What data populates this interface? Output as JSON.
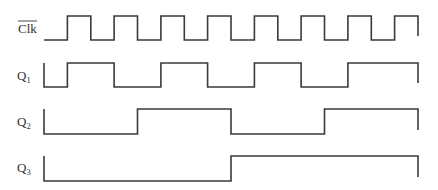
{
  "diagram": {
    "type": "timing-diagram",
    "time_steps": 16,
    "signals": [
      {
        "id": "clk_bar",
        "label": "Clk",
        "label_overbar": true,
        "subscript": "",
        "initial_level": 0,
        "levels": [
          0,
          1,
          0,
          1,
          0,
          1,
          0,
          1,
          0,
          1,
          0,
          1,
          0,
          1,
          0,
          1
        ],
        "final_drop": true
      },
      {
        "id": "q1",
        "label": "Q",
        "label_overbar": false,
        "subscript": "1",
        "initial_level": 1,
        "levels": [
          0,
          1,
          1,
          0,
          0,
          1,
          1,
          0,
          0,
          1,
          1,
          0,
          0,
          1,
          1,
          1
        ],
        "final_drop": true
      },
      {
        "id": "q2",
        "label": "Q",
        "label_overbar": false,
        "subscript": "2",
        "initial_level": 1,
        "levels": [
          0,
          0,
          0,
          0,
          1,
          1,
          1,
          1,
          0,
          0,
          0,
          0,
          1,
          1,
          1,
          1
        ],
        "final_drop": true
      },
      {
        "id": "q3",
        "label": "Q",
        "label_overbar": false,
        "subscript": "3",
        "initial_level": 1,
        "levels": [
          0,
          0,
          0,
          0,
          0,
          0,
          0,
          0,
          1,
          1,
          1,
          1,
          1,
          1,
          1,
          1
        ],
        "final_drop": true
      }
    ]
  }
}
